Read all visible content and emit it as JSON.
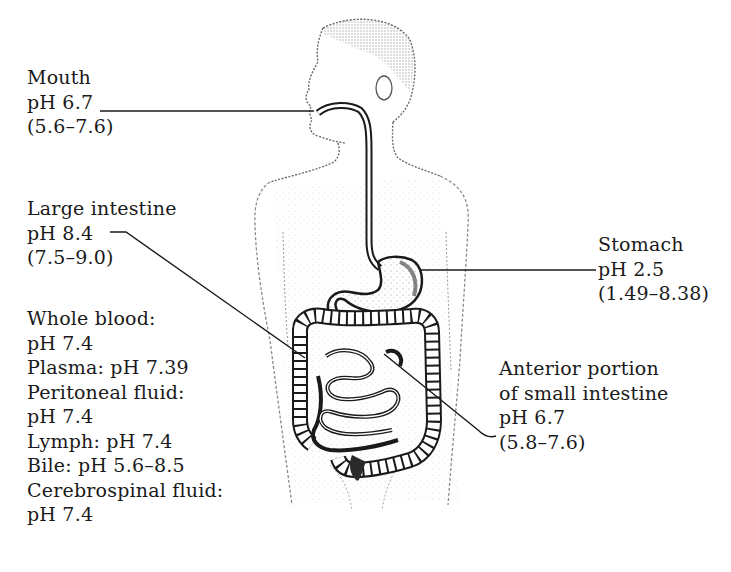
{
  "figure": {
    "colors": {
      "ink": "#1a1a1a",
      "background": "#ffffff",
      "stipple": "#9a9a9a"
    }
  },
  "labels": {
    "mouth": {
      "name": "Mouth",
      "ph": "pH 6.7",
      "range": "(5.6–7.6)"
    },
    "large_intestine": {
      "name": "Large intestine",
      "ph": "pH 8.4",
      "range": "(7.5–9.0)"
    },
    "stomach": {
      "name": "Stomach",
      "ph": "pH 2.5",
      "range": "(1.49–8.38)"
    },
    "small_intestine": {
      "line1": "Anterior portion",
      "line2": "of small intestine",
      "ph": "pH 6.7",
      "range": "(5.8–7.6)"
    },
    "fluids": [
      "Whole blood:",
      "pH 7.4",
      "Plasma: pH 7.39",
      "Peritoneal fluid:",
      "pH 7.4",
      "Lymph: pH 7.4",
      "Bile: pH 5.6–8.5",
      "Cerebrospinal fluid:",
      "pH 7.4"
    ]
  }
}
